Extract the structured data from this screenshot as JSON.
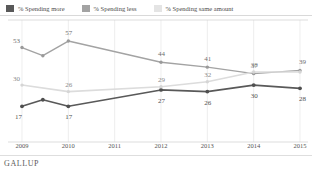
{
  "legend": {
    "items": [
      {
        "label": "% Spending more",
        "color": "#595959"
      },
      {
        "label": "% Spending less",
        "color": "#a3a3a3"
      },
      {
        "label": "% Spending same amount",
        "color": "#dcdcdc"
      }
    ]
  },
  "footer": {
    "brand": "GALLUP"
  },
  "chart_data": {
    "type": "line",
    "title": "",
    "subtitle": "",
    "xlabel": "",
    "ylabel": "",
    "grid": "vertical",
    "legend_position": "top",
    "xlim": [
      2009,
      2015
    ],
    "ylim": [
      0,
      65
    ],
    "categories": [
      "2009",
      "2010",
      "2011",
      "2012",
      "2013",
      "2014",
      "2015"
    ],
    "tick_labels": [
      "2009",
      "2010",
      "2011",
      "2012",
      "2013",
      "2014",
      "2015"
    ],
    "series": [
      {
        "name": "% Spending more",
        "color": "#595959",
        "x": [
          2009,
          2009.45,
          2010,
          2012,
          2013,
          2014,
          2015
        ],
        "values": [
          17,
          21,
          17,
          27,
          26,
          30,
          28
        ],
        "labels": [
          "17",
          "",
          "17",
          "27",
          "26",
          "30",
          "28"
        ]
      },
      {
        "name": "% Spending less",
        "color": "#a3a3a3",
        "x": [
          2009,
          2009.45,
          2010,
          2012,
          2013,
          2014,
          2015
        ],
        "values": [
          53,
          48,
          57,
          44,
          41,
          37,
          39
        ],
        "labels": [
          "53",
          "",
          "57",
          "44",
          "41",
          "37",
          "39"
        ]
      },
      {
        "name": "% Spending same amount",
        "color": "#dcdcdc",
        "x": [
          2009,
          2010,
          2012,
          2013,
          2014,
          2015
        ],
        "values": [
          30,
          26,
          29,
          32,
          38,
          38
        ],
        "labels": [
          "30",
          "26",
          "29",
          "32",
          "38",
          ""
        ]
      }
    ]
  }
}
